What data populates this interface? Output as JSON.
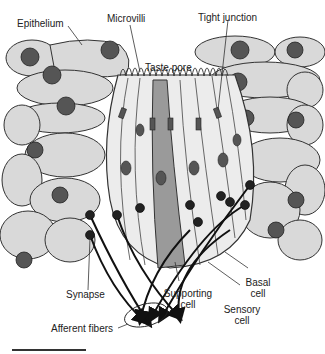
{
  "figure": {
    "labels": {
      "epithelium": "Epithelium",
      "microvilli": "Microvilli",
      "tight_junction": "Tight junction",
      "taste_pore": "Taste pore",
      "synapse": "Synapse",
      "supporting_cell_1": "Supporting",
      "supporting_cell_2": "cell",
      "basal_cell_1": "Basal",
      "basal_cell_2": "cell",
      "sensory_cell_1": "Sensory",
      "sensory_cell_2": "cell",
      "afferent_fibers": "Afferent fibers"
    },
    "colors": {
      "cell_fill": "#d9d9d9",
      "cell_light": "#ececec",
      "supporting_fill": "#9a9a9a",
      "outline": "#333333",
      "nucleus": "#555555",
      "fiber": "#111111"
    }
  }
}
